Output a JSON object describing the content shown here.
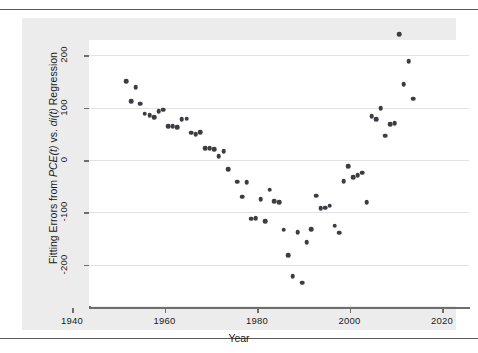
{
  "figure": {
    "background_color": "#ececec",
    "plot_background_color": "#ffffff",
    "point_color": "#3c3c44",
    "grid_color": "#e2e2e2",
    "axis_color": "#6e6e6e"
  },
  "axis": {
    "xlabel": "Year",
    "ylabel_parts": {
      "a": "Fitting Errors from ",
      "b": "PCE(t)",
      "c": " vs. ",
      "d": "di(t)",
      "e": " Regression"
    },
    "ylabel_full": "Fitting Errors from PCE(t) vs. di(t) Regression",
    "xticks": [
      "1940",
      "1960",
      "1980",
      "2000",
      "2020"
    ],
    "yticks": [
      "200",
      "100",
      "0",
      "-100",
      "-200"
    ]
  },
  "chart_data": {
    "type": "scatter",
    "title": "",
    "xlabel": "Year",
    "ylabel": "Fitting Errors from PCE(t) vs. di(t) Regression",
    "xlim": [
      1935,
      2022
    ],
    "ylim": [
      -245,
      255
    ],
    "xticks": [
      1940,
      1960,
      1980,
      2000,
      2020
    ],
    "yticks": [
      -200,
      -100,
      0,
      100,
      200
    ],
    "grid": "horizontal",
    "legend": null,
    "series": [
      {
        "name": "Fitting errors",
        "marker": "filled-circle",
        "color": "#3c3c44",
        "points": [
          [
            1947,
            150
          ],
          [
            1948,
            112
          ],
          [
            1949,
            139
          ],
          [
            1950,
            107
          ],
          [
            1951,
            88
          ],
          [
            1952,
            85
          ],
          [
            1953,
            82
          ],
          [
            1954,
            93
          ],
          [
            1955,
            96
          ],
          [
            1956,
            65
          ],
          [
            1957,
            64
          ],
          [
            1958,
            62
          ],
          [
            1959,
            78
          ],
          [
            1960,
            79
          ],
          [
            1961,
            52
          ],
          [
            1962,
            49
          ],
          [
            1963,
            53
          ],
          [
            1964,
            23
          ],
          [
            1965,
            22
          ],
          [
            1966,
            21
          ],
          [
            1967,
            7
          ],
          [
            1968,
            17
          ],
          [
            1969,
            -17
          ],
          [
            1971,
            -41
          ],
          [
            1972,
            -70
          ],
          [
            1973,
            -42
          ],
          [
            1974,
            -112
          ],
          [
            1975,
            -111
          ],
          [
            1976,
            -75
          ],
          [
            1977,
            -117
          ],
          [
            1978,
            -57
          ],
          [
            1979,
            -78
          ],
          [
            1980,
            -80
          ],
          [
            1981,
            -133
          ],
          [
            1982,
            -182
          ],
          [
            1983,
            -221
          ],
          [
            1984,
            -138
          ],
          [
            1985,
            -234
          ],
          [
            1986,
            -157
          ],
          [
            1987,
            -132
          ],
          [
            1988,
            -68
          ],
          [
            1989,
            -92
          ],
          [
            1990,
            -91
          ],
          [
            1991,
            -87
          ],
          [
            1992,
            -125
          ],
          [
            1993,
            -139
          ],
          [
            1994,
            -40
          ],
          [
            1995,
            -12
          ],
          [
            1996,
            -33
          ],
          [
            1997,
            -29
          ],
          [
            1998,
            -24
          ],
          [
            1999,
            -81
          ],
          [
            2000,
            83
          ],
          [
            2001,
            78
          ],
          [
            2002,
            99
          ],
          [
            2003,
            46
          ],
          [
            2004,
            68
          ],
          [
            2005,
            70
          ],
          [
            2006,
            240
          ],
          [
            2007,
            145
          ],
          [
            2008,
            188
          ],
          [
            2009,
            117
          ]
        ]
      }
    ]
  }
}
